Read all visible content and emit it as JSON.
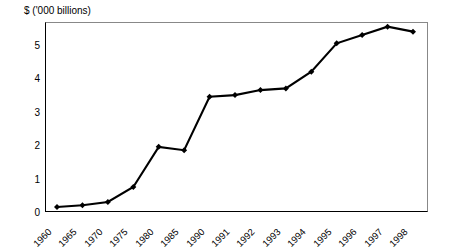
{
  "chart_data": {
    "type": "line",
    "title": "",
    "subtitle": "",
    "xlabel": "",
    "ylabel": "$ ('000 billions)",
    "ylim": [
      0,
      6
    ],
    "yticks": [
      0,
      1,
      2,
      3,
      4,
      5
    ],
    "ytick_labels": [
      "0",
      "1",
      "2",
      "3",
      "4",
      "5"
    ],
    "grid": false,
    "legend": null,
    "marker": "diamond",
    "line_color": "#000000",
    "categories": [
      "1960",
      "1965",
      "1970",
      "1975",
      "1980",
      "1985",
      "1990",
      "1991",
      "1992",
      "1993",
      "1994",
      "1995",
      "1996",
      "1997",
      "1998"
    ],
    "x": [
      "1960",
      "1965",
      "1970",
      "1975",
      "1980",
      "1985",
      "1990",
      "1991",
      "1992",
      "1993",
      "1994",
      "1995",
      "1996",
      "1997",
      "1998"
    ],
    "values": [
      0.15,
      0.2,
      0.3,
      0.75,
      1.95,
      1.85,
      3.45,
      3.5,
      3.65,
      3.7,
      4.2,
      5.05,
      5.3,
      5.55,
      5.4
    ],
    "series": [
      {
        "name": "",
        "values": [
          0.15,
          0.2,
          0.3,
          0.75,
          1.95,
          1.85,
          3.45,
          3.5,
          3.65,
          3.7,
          4.2,
          5.05,
          5.3,
          5.55,
          5.4
        ]
      }
    ],
    "annotations": []
  },
  "axis": {
    "y_caption": "$ ('000 billions)",
    "y_tick_labels": [
      "5",
      "4",
      "3",
      "2",
      "1",
      "0"
    ],
    "x_tick_labels": [
      "1960",
      "1965",
      "1970",
      "1975",
      "1980",
      "1985",
      "1990",
      "1991",
      "1992",
      "1993",
      "1994",
      "1995",
      "1996",
      "1997",
      "1998"
    ]
  },
  "colors": {
    "line": "#000000",
    "marker": "#000000",
    "axis": "#000000",
    "frame": "#888888",
    "background": "#ffffff"
  }
}
